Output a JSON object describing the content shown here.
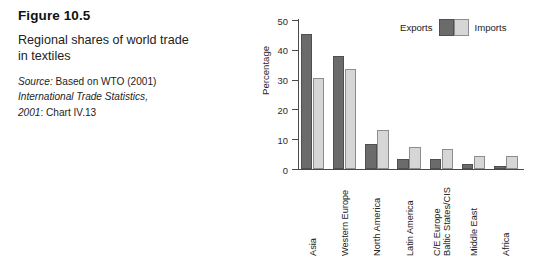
{
  "caption": {
    "figure_number": "Figure 10.5",
    "title": "Regional shares of world trade in textiles",
    "source_prefix": "Source:",
    "source_line1_rest": " Based on WTO (2001)",
    "source_line2": "International Trade Statistics,",
    "source_line3_italic": "2001",
    "source_line3_rest": ": Chart IV.13"
  },
  "legend": {
    "exports_label": "Exports",
    "imports_label": "Imports",
    "exports_color": "#6b6b6b",
    "imports_color": "#d6d6d6"
  },
  "axes": {
    "y_title": "Percentage",
    "y_ticks": [
      "0",
      "10",
      "20",
      "30",
      "40",
      "50"
    ]
  },
  "chart_data": {
    "type": "bar",
    "title": "Regional shares of world trade in textiles",
    "xlabel": "",
    "ylabel": "Percentage",
    "ylim": [
      0,
      50
    ],
    "grid": false,
    "legend_position": "top-right",
    "categories": [
      "Asia",
      "Western Europe",
      "North America",
      "Latin America",
      "C/E Europe\nBaltic States/CIS",
      "Middle East",
      "Africa"
    ],
    "series": [
      {
        "name": "Exports",
        "color": "#6b6b6b",
        "values": [
          45.3,
          37.8,
          8.5,
          3.3,
          3.5,
          1.6,
          1.1
        ]
      },
      {
        "name": "Imports",
        "color": "#d6d6d6",
        "values": [
          30.6,
          33.5,
          13.1,
          7.5,
          6.8,
          4.2,
          4.4
        ]
      }
    ]
  }
}
